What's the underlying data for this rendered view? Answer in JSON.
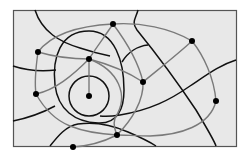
{
  "diagram": {
    "type": "network-over-regions",
    "colors": {
      "background": "#ffffff",
      "frame_fill": "#e8e8e8",
      "frame_stroke": "#555555",
      "boundary": "#111111",
      "edge": "#7a7a7a",
      "node": "#000000"
    },
    "frame": {
      "x": 13,
      "y": 10,
      "w": 223,
      "h": 136
    },
    "nodes": [
      {
        "id": "A",
        "x": 38,
        "y": 52
      },
      {
        "id": "B",
        "x": 113,
        "y": 24
      },
      {
        "id": "C",
        "x": 89,
        "y": 59
      },
      {
        "id": "D",
        "x": 192,
        "y": 41
      },
      {
        "id": "E",
        "x": 143,
        "y": 82
      },
      {
        "id": "F",
        "x": 36,
        "y": 94
      },
      {
        "id": "G",
        "x": 89,
        "y": 96
      },
      {
        "id": "H",
        "x": 216,
        "y": 101
      },
      {
        "id": "I",
        "x": 117,
        "y": 135
      },
      {
        "id": "J",
        "x": 73,
        "y": 147
      }
    ]
  }
}
